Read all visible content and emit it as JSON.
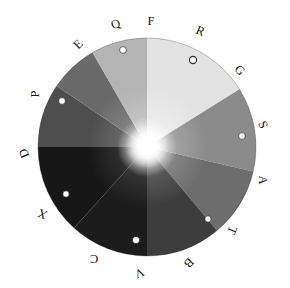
{
  "figure": {
    "background_color": "#ffffff",
    "canvas": {
      "width": 290,
      "height": 288
    }
  },
  "wheel": {
    "center_x": 147,
    "center_y": 147,
    "radius": 109,
    "center_highlight_color": "#ffffff",
    "outline_color": "#1a1a1a"
  },
  "perimeter_labels": [
    {
      "id": "F",
      "text": "F",
      "angle_deg": 0,
      "rotation_deg": 0,
      "x": 151,
      "y": 22
    },
    {
      "id": "R",
      "text": "R",
      "angle_deg": 22.5,
      "rotation_deg": 22.5,
      "x": 200,
      "y": 32
    },
    {
      "id": "G",
      "text": "G",
      "angle_deg": 45,
      "rotation_deg": 45,
      "x": 239,
      "y": 71
    },
    {
      "id": "S",
      "text": "S",
      "angle_deg": 67.5,
      "rotation_deg": 67.5,
      "x": 262,
      "y": 125
    },
    {
      "id": "A",
      "text": "A",
      "angle_deg": 90,
      "rotation_deg": 90,
      "x": 262,
      "y": 180
    },
    {
      "id": "T",
      "text": "T",
      "angle_deg": 112.5,
      "rotation_deg": 112.5,
      "x": 231,
      "y": 230
    },
    {
      "id": "B",
      "text": "B",
      "angle_deg": 135,
      "rotation_deg": 135,
      "x": 188,
      "y": 262
    },
    {
      "id": "V",
      "text": "V",
      "angle_deg": 157.5,
      "rotation_deg": 157.5,
      "x": 139,
      "y": 272
    },
    {
      "id": "C",
      "text": "C",
      "angle_deg": 180,
      "rotation_deg": 180,
      "x": 94,
      "y": 258
    },
    {
      "id": "X",
      "text": "X",
      "angle_deg": 202.5,
      "rotation_deg": 202.5,
      "x": 43,
      "y": 213
    },
    {
      "id": "D",
      "text": "D",
      "angle_deg": 247.5,
      "rotation_deg": 247.5,
      "x": 25,
      "y": 153
    },
    {
      "id": "P",
      "text": "P",
      "angle_deg": 270,
      "rotation_deg": 270,
      "x": 36,
      "y": 94
    },
    {
      "id": "E",
      "text": "E",
      "angle_deg": 315,
      "rotation_deg": 315,
      "x": 79,
      "y": 45
    },
    {
      "id": "Q",
      "text": "Q",
      "angle_deg": 337.5,
      "rotation_deg": 337.5,
      "x": 116,
      "y": 25
    },
    {
      "id": "O",
      "text": "O",
      "angle_deg": 30,
      "rotation_deg": 30,
      "x": 193,
      "y": 60
    }
  ],
  "chart_data": {
    "type": "pie",
    "xlabel": "",
    "ylabel": "",
    "grid": false,
    "legend_position": "perimeter",
    "center_hotspot": {
      "x": 147,
      "y": 147,
      "color": "#ffffff"
    },
    "categories": [
      "F-G",
      "G-S",
      "S-A",
      "A-B",
      "B-C",
      "C-X",
      "X-P",
      "P-Q",
      "Q-F"
    ],
    "values": [
      60,
      40,
      50,
      40,
      45,
      40,
      45,
      45,
      35
    ],
    "sectors": [
      {
        "name": "F-G",
        "label": "F",
        "start_deg": 0,
        "end_deg": 58,
        "gray_outer": "#e3e3e3",
        "gray_mid": "#ededed"
      },
      {
        "name": "G-S",
        "label": "G",
        "start_deg": 58,
        "end_deg": 103,
        "gray_outer": "#8b8b8b",
        "gray_mid": "#a8a8a8"
      },
      {
        "name": "S-A",
        "label": "S",
        "start_deg": 103,
        "end_deg": 140,
        "gray_outer": "#6d6d6d",
        "gray_mid": "#8a8a8a"
      },
      {
        "name": "A-B",
        "label": "A",
        "start_deg": 140,
        "end_deg": 180,
        "gray_outer": "#3d3d3d",
        "gray_mid": "#606060"
      },
      {
        "name": "B-C",
        "label": "B",
        "start_deg": 180,
        "end_deg": 222,
        "gray_outer": "#1c1c1c",
        "gray_mid": "#3a3a3a"
      },
      {
        "name": "C-X",
        "label": "C",
        "start_deg": 222,
        "end_deg": 270,
        "gray_outer": "#171717",
        "gray_mid": "#343434"
      },
      {
        "name": "X-P",
        "label": "X",
        "start_deg": 270,
        "end_deg": 304,
        "gray_outer": "#4e4e4e",
        "gray_mid": "#6b6b6b"
      },
      {
        "name": "P-Q",
        "label": "P",
        "start_deg": 304,
        "end_deg": 330,
        "gray_outer": "#6a6a6a",
        "gray_mid": "#868686"
      },
      {
        "name": "Q-F",
        "label": "Q",
        "start_deg": 330,
        "end_deg": 360,
        "gray_outer": "#b4b4b4",
        "gray_mid": "#c6c6c6"
      }
    ],
    "markers": [
      {
        "id": "marker-q",
        "x": 123,
        "y": 50,
        "r": 3.4,
        "on_light": false
      },
      {
        "id": "marker-o",
        "x": 193,
        "y": 60,
        "r": 3.6,
        "on_light": true
      },
      {
        "id": "marker-s",
        "x": 242,
        "y": 136,
        "r": 3.4,
        "on_light": false
      },
      {
        "id": "marker-t",
        "x": 208,
        "y": 219,
        "r": 3.2,
        "on_light": false
      },
      {
        "id": "marker-v",
        "x": 136,
        "y": 240,
        "r": 3.6,
        "on_light": false
      },
      {
        "id": "marker-x",
        "x": 66,
        "y": 194,
        "r": 3.2,
        "on_light": false
      },
      {
        "id": "marker-p",
        "x": 62,
        "y": 101,
        "r": 3.4,
        "on_light": false
      }
    ]
  }
}
